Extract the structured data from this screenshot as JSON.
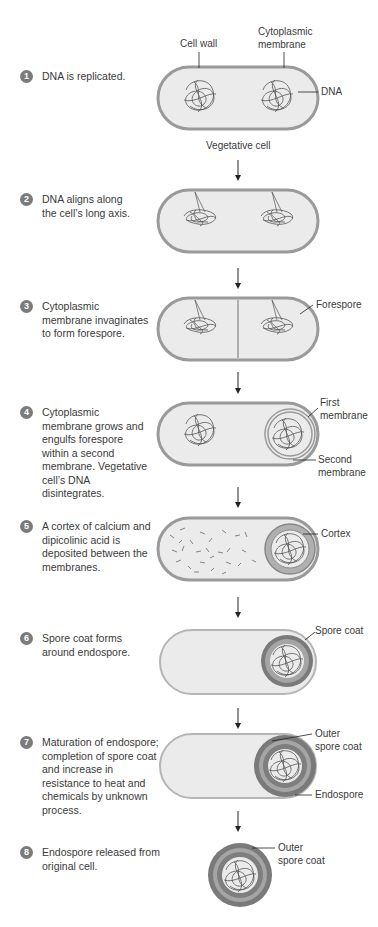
{
  "steps": [
    {
      "num": "1",
      "text": "DNA is replicated."
    },
    {
      "num": "2",
      "text": "DNA aligns along the cell’s long axis."
    },
    {
      "num": "3",
      "text": "Cytoplasmic membrane invaginates to form forespore."
    },
    {
      "num": "4",
      "text": "Cytoplasmic membrane grows and engulfs forespore within a second membrane. Vegetative cell’s DNA disintegrates."
    },
    {
      "num": "5",
      "text": "A cortex of calcium and dipicolinic acid is deposited between the membranes."
    },
    {
      "num": "6",
      "text": "Spore coat forms around endospore."
    },
    {
      "num": "7",
      "text": "Maturation of endospore; completion of spore coat and increase in resistance to heat and chemicals by unknown process."
    },
    {
      "num": "8",
      "text": "Endospore released from original cell."
    }
  ],
  "labels": {
    "cell_wall": "Cell wall",
    "cytoplasmic_membrane": "Cytoplasmic membrane",
    "dna": "DNA",
    "vegetative_cell": "Vegetative cell",
    "forespore": "Forespore",
    "first_membrane": "First membrane",
    "second_membrane": "Second membrane",
    "cortex": "Cortex",
    "spore_coat": "Spore coat",
    "outer_spore_coat_7": "Outer spore coat",
    "endospore": "Endospore",
    "outer_spore_coat_8": "Outer spore coat"
  },
  "colors": {
    "cell_wall": "#9a9a9a",
    "cell_fill": "#ebebeb",
    "spore_coat": "#7a7a7a",
    "step_badge": "#7b7b7b"
  }
}
